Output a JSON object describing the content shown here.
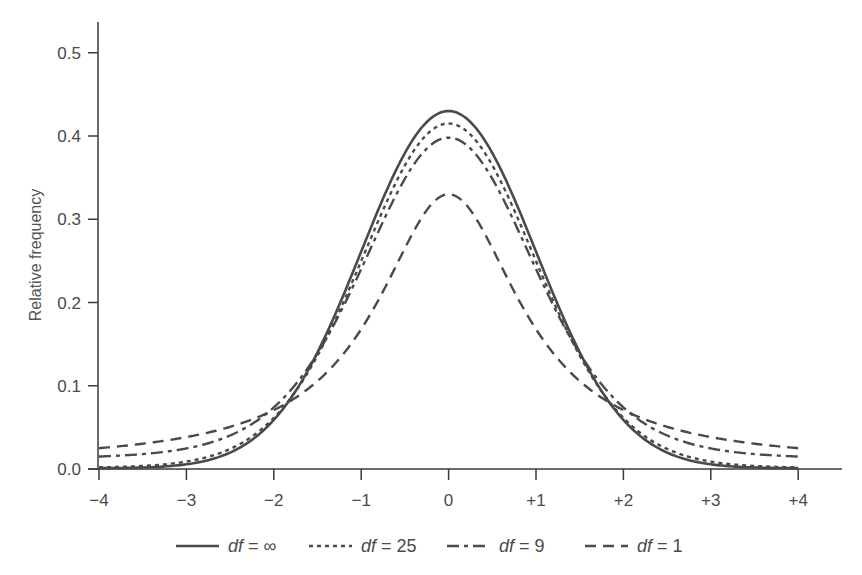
{
  "chart_data": {
    "type": "line",
    "title": "",
    "xlabel": "",
    "ylabel": "Relative frequency",
    "xlim": [
      -4,
      4
    ],
    "ylim": [
      0,
      0.5
    ],
    "grid": false,
    "legend_position": "bottom",
    "x_ticks": [
      -4,
      -3,
      -2,
      -1,
      0,
      1,
      2,
      3,
      4
    ],
    "x_tick_labels": [
      "−4",
      "−3",
      "−2",
      "−1",
      "0",
      "+1",
      "+2",
      "+3",
      "+4"
    ],
    "y_ticks": [
      0.0,
      0.1,
      0.2,
      0.3,
      0.4,
      0.5
    ],
    "y_tick_labels": [
      "0.0",
      "0.1",
      "0.2",
      "0.3",
      "0.4",
      "0.5"
    ],
    "x": [
      -4,
      -3.5,
      -3,
      -2.5,
      -2,
      -1.5,
      -1,
      -0.5,
      0,
      0.5,
      1,
      1.5,
      2,
      2.5,
      3,
      3.5,
      4
    ],
    "series": [
      {
        "name": "df = ∞",
        "style": "solid",
        "values": [
          0.001,
          0.004,
          0.014,
          0.033,
          0.07,
          0.137,
          0.245,
          0.37,
          0.43,
          0.37,
          0.245,
          0.137,
          0.07,
          0.033,
          0.014,
          0.004,
          0.001
        ]
      },
      {
        "name": "df = 25",
        "style": "dotted",
        "values": [
          0.002,
          0.006,
          0.017,
          0.036,
          0.072,
          0.138,
          0.242,
          0.36,
          0.415,
          0.36,
          0.242,
          0.138,
          0.072,
          0.036,
          0.017,
          0.006,
          0.002
        ]
      },
      {
        "name": "df = 9",
        "style": "dashdot",
        "values": [
          0.015,
          0.02,
          0.03,
          0.047,
          0.076,
          0.138,
          0.232,
          0.345,
          0.398,
          0.345,
          0.232,
          0.138,
          0.076,
          0.047,
          0.03,
          0.02,
          0.015
        ]
      },
      {
        "name": "df = 1",
        "style": "dashed",
        "values": [
          0.025,
          0.03,
          0.038,
          0.052,
          0.074,
          0.115,
          0.185,
          0.275,
          0.33,
          0.275,
          0.185,
          0.115,
          0.074,
          0.052,
          0.038,
          0.03,
          0.025
        ]
      }
    ]
  },
  "axes": {
    "ylabel": "Relative frequency",
    "x_tick_labels": [
      "−4",
      "−3",
      "−2",
      "−1",
      "0",
      "+1",
      "+2",
      "+3",
      "+4"
    ],
    "y_tick_labels": [
      "0.0",
      "0.1",
      "0.2",
      "0.3",
      "0.4",
      "0.5"
    ]
  },
  "legend": {
    "items": [
      {
        "prefix": "df",
        "suffix": " = ∞"
      },
      {
        "prefix": "df",
        "suffix": " = 25"
      },
      {
        "prefix": "df",
        "suffix": " = 9"
      },
      {
        "prefix": "df",
        "suffix": " = 1"
      }
    ]
  },
  "colors": {
    "line": "#4a4a4a",
    "axis": "#3a3a3a",
    "text": "#4a4a4a"
  }
}
